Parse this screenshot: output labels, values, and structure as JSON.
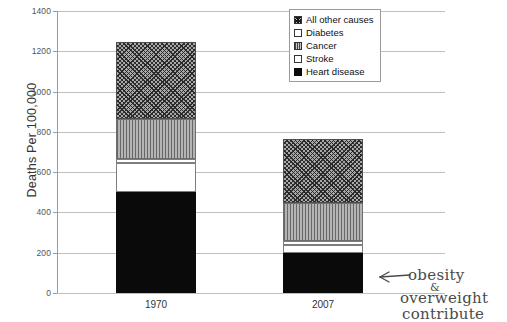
{
  "chart_data": {
    "type": "bar",
    "subtype": "stacked-bar",
    "title": "",
    "xlabel": "",
    "ylabel": "Deaths Per 100,000",
    "categories": [
      "1970",
      "2007"
    ],
    "ylim": [
      0,
      1400
    ],
    "yticks": [
      0,
      200,
      400,
      600,
      800,
      1000,
      1200,
      1400
    ],
    "ytick_labels": [
      "0",
      "200",
      "400",
      "600",
      "800",
      "1000",
      "1200",
      "1400"
    ],
    "grid": true,
    "legend_position": "top-right",
    "series": [
      {
        "name": "Heart disease",
        "values": [
          500,
          200
        ],
        "pattern": "solid-black",
        "color": "#0a0a0a"
      },
      {
        "name": "Stroke",
        "values": [
          145,
          40
        ],
        "pattern": "empty-white",
        "color": "#ffffff"
      },
      {
        "name": "Diabetes",
        "values": [
          20,
          20
        ],
        "pattern": "empty-white",
        "color": "#ffffff"
      },
      {
        "name": "Cancer",
        "values": [
          200,
          185
        ],
        "pattern": "vertical-lines",
        "color": "#b4b4b4"
      },
      {
        "name": "All other causes",
        "values": [
          380,
          320
        ],
        "pattern": "cross-hatch",
        "color": "#a8a8a8"
      }
    ],
    "totals": [
      1245,
      765
    ],
    "annotations": [
      {
        "text": "obesity & overweight contribute",
        "type": "handwritten-arrow",
        "target": "2007"
      }
    ]
  },
  "legend": {
    "items": [
      {
        "label": "All other causes",
        "swatch": "crosshatch-swatch"
      },
      {
        "label": "Diabetes",
        "swatch": "white-swatch"
      },
      {
        "label": "Cancer",
        "swatch": "vertical-lines-swatch"
      },
      {
        "label": "Stroke",
        "swatch": "white-swatch"
      },
      {
        "label": "Heart disease",
        "swatch": "black-swatch"
      }
    ]
  },
  "annotation": {
    "line1": "obesity",
    "line2": "&",
    "line3": "overweight",
    "line4": "contribute"
  }
}
